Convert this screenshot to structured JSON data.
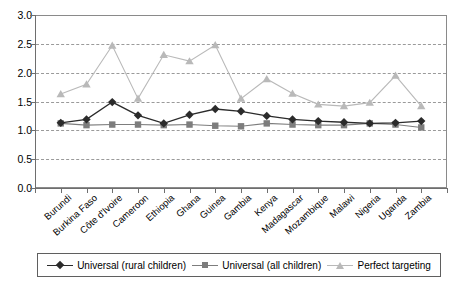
{
  "chart_data": {
    "type": "line",
    "title": "",
    "subtitle": "",
    "xlabel": "",
    "ylabel": "",
    "ylim": [
      0.0,
      3.0
    ],
    "ytick_step": 0.5,
    "grid": true,
    "grid_style": "horizontal-dashed",
    "legend_position": "bottom",
    "categories": [
      "Burundi",
      "Burkina Faso",
      "Côte d'Ivoire",
      "Cameroon",
      "Ethiopia",
      "Ghana",
      "Guinea",
      "Gambia",
      "Kenya",
      "Madagascar",
      "Mozambique",
      "Malawi",
      "Nigeria",
      "Uganda",
      "Zambia"
    ],
    "yticks": [
      "0.0",
      "0.5",
      "1.0",
      "1.5",
      "2.0",
      "2.5",
      "3.0"
    ],
    "series": [
      {
        "name": "Universal (rural children)",
        "marker": "diamond",
        "color": "#2b2b2b",
        "values": [
          1.13,
          1.19,
          1.49,
          1.26,
          1.12,
          1.27,
          1.37,
          1.33,
          1.25,
          1.19,
          1.16,
          1.14,
          1.12,
          1.13,
          1.16
        ]
      },
      {
        "name": "Universal (all children)",
        "marker": "square",
        "color": "#7d7d7d",
        "values": [
          1.12,
          1.09,
          1.1,
          1.1,
          1.09,
          1.1,
          1.08,
          1.07,
          1.12,
          1.1,
          1.09,
          1.09,
          1.12,
          1.1,
          1.05
        ]
      },
      {
        "name": "Perfect targeting",
        "marker": "triangle",
        "color": "#b9b9b9",
        "values": [
          1.63,
          1.8,
          2.47,
          1.55,
          2.31,
          2.2,
          2.48,
          1.55,
          1.89,
          1.64,
          1.45,
          1.42,
          1.48,
          1.95,
          1.42
        ]
      }
    ]
  },
  "legend": {
    "items": [
      {
        "label": "Universal (rural children)",
        "marker": "diamond",
        "color": "#2b2b2b"
      },
      {
        "label": "Universal (all children)",
        "marker": "square",
        "color": "#7d7d7d"
      },
      {
        "label": "Perfect targeting",
        "marker": "triangle",
        "color": "#b9b9b9"
      }
    ]
  }
}
